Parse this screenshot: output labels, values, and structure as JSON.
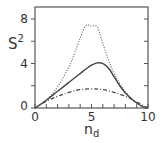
{
  "chart_data": {
    "type": "line",
    "title": "",
    "xlabel": "n_d",
    "ylabel": "S^2",
    "xlabel_main": "n",
    "xlabel_sub": "d",
    "ylabel_main": "S",
    "ylabel_sup": "2",
    "xlim": [
      0,
      10
    ],
    "ylim": [
      0,
      8.8
    ],
    "x_ticks": [
      0,
      1,
      2,
      3,
      4,
      5,
      6,
      7,
      8,
      9,
      10
    ],
    "x_tick_labels": {
      "0": "0",
      "5": "5",
      "10": "10"
    },
    "y_ticks": [
      0,
      2,
      4,
      6,
      8
    ],
    "y_tick_labels": {
      "0": "0",
      "4": "4",
      "8": "8"
    },
    "grid": false,
    "legend": null,
    "series": [
      {
        "name": "dotted",
        "style": "dotted",
        "x": [
          0,
          1,
          2,
          3,
          3.5,
          4,
          4.5,
          5,
          5.5,
          6,
          6.5,
          7,
          7.5,
          8,
          8.5,
          9,
          9.5,
          10
        ],
        "y": [
          0,
          0.7,
          1.9,
          3.7,
          4.9,
          6.3,
          7.4,
          7.35,
          7.3,
          5.8,
          4.3,
          3.1,
          2.2,
          1.45,
          0.9,
          0.45,
          0.15,
          0
        ]
      },
      {
        "name": "solid",
        "style": "solid",
        "x": [
          0,
          1,
          2,
          3,
          4,
          4.5,
          5,
          5.5,
          5.8,
          6,
          6.5,
          7,
          7.5,
          8,
          8.5,
          9,
          9.5,
          10
        ],
        "y": [
          0,
          0.7,
          1.5,
          2.3,
          3.1,
          3.5,
          3.85,
          4.05,
          4.05,
          4.0,
          3.6,
          2.8,
          2.0,
          1.35,
          0.85,
          0.45,
          0.15,
          0
        ]
      },
      {
        "name": "dash-dot",
        "style": "dash-dot",
        "x": [
          0,
          1,
          2,
          3,
          4,
          5,
          6,
          7,
          8,
          9,
          10
        ],
        "y": [
          0,
          0.6,
          1.05,
          1.4,
          1.65,
          1.72,
          1.65,
          1.4,
          1.05,
          0.55,
          0
        ]
      }
    ]
  }
}
